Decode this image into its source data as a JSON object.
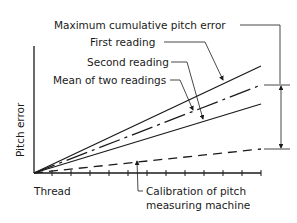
{
  "diagram": {
    "axes": {
      "y_label": "Pitch error",
      "x_label": "Thread"
    },
    "annotations": {
      "max_error": "Maximum cumulative pitch error",
      "first_reading": "First reading",
      "second_reading": "Second reading",
      "mean_reading": "Mean of two readings",
      "calibration_line1": "Calibration of pitch",
      "calibration_line2": "measuring machine"
    },
    "lines": [
      {
        "name": "First reading",
        "style": "solid"
      },
      {
        "name": "Mean of two readings",
        "style": "dash-dot"
      },
      {
        "name": "Second reading",
        "style": "solid"
      },
      {
        "name": "Calibration of pitch measuring machine",
        "style": "dashed"
      }
    ],
    "x_tick_count": 12,
    "colors": {
      "ink": "#1a1a1a",
      "background": "#ffffff"
    }
  }
}
